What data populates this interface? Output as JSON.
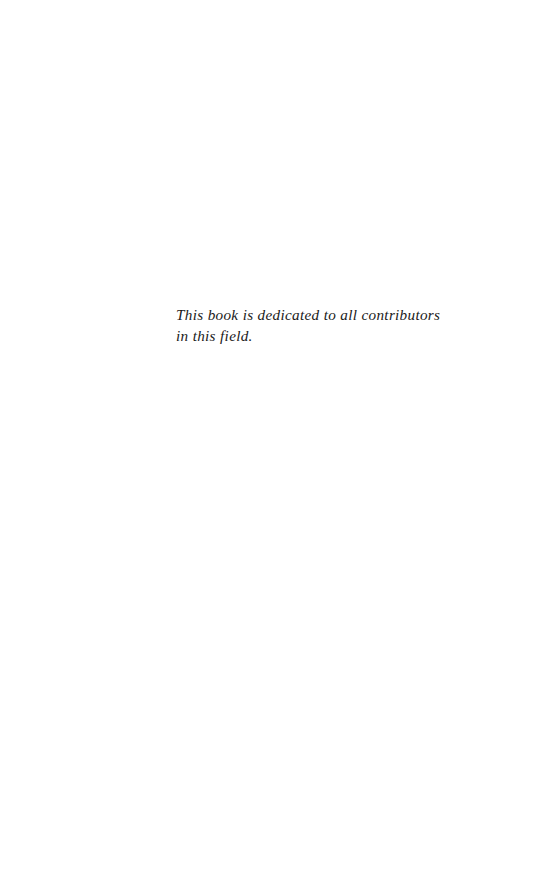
{
  "page": {
    "width": 539,
    "height": 890,
    "background_color": "#ffffff",
    "kind": "dedication-page"
  },
  "dedication": {
    "text": "This book is dedicated to all contributors in this field.",
    "style": "italic",
    "text_color": "#1a1a1a",
    "lines": [
      "This book is dedicated to all contributors in",
      "this field."
    ]
  },
  "header": {
    "running_head": "",
    "folio": ""
  },
  "footer": {
    "page_number": ""
  }
}
